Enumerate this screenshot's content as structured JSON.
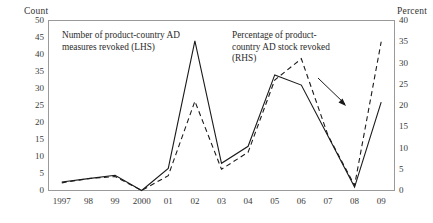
{
  "chart_data": {
    "type": "line",
    "title": "",
    "xlabel": "",
    "ylabel": "Count",
    "y2label": "Percent",
    "grid": false,
    "legend_position": "inline-annotations",
    "categories": [
      "1997",
      "98",
      "99",
      "2000",
      "01",
      "02",
      "03",
      "04",
      "05",
      "06",
      "07",
      "08",
      "09"
    ],
    "x": [
      1997,
      1998,
      1999,
      2000,
      2001,
      2002,
      2003,
      2004,
      2005,
      2006,
      2007,
      2008,
      2009
    ],
    "ylim": [
      0,
      50
    ],
    "y2lim": [
      0,
      40
    ],
    "yticks": [
      0,
      5,
      10,
      15,
      20,
      25,
      30,
      35,
      40,
      45,
      50
    ],
    "y2ticks": [
      0,
      5,
      10,
      15,
      20,
      25,
      30,
      35,
      40
    ],
    "series": [
      {
        "name": "Number of product-country AD measures revoked (LHS)",
        "axis": "left",
        "style": "solid",
        "values": [
          2.5,
          3.5,
          4.5,
          0,
          6.5,
          44,
          8,
          13,
          34,
          31,
          16,
          1,
          26
        ]
      },
      {
        "name": "Percentage of product-country AD stock revoked (RHS)",
        "axis": "right",
        "style": "dashed",
        "values": [
          1.8,
          2.8,
          3.3,
          0,
          3.5,
          21,
          5,
          9,
          26,
          31,
          13,
          1.2,
          35
        ]
      }
    ],
    "annotations": [
      {
        "id": "lhs-label",
        "text": "Number of product-country AD measures revoked (LHS)",
        "lines": [
          "Number of product-country AD",
          "measures revoked (LHS)"
        ]
      },
      {
        "id": "rhs-label",
        "text": "Percentage of product-country AD stock revoked (RHS)",
        "lines": [
          "Percentage of product-",
          "country AD stock revoked",
          "(RHS)"
        ],
        "arrow": true
      }
    ],
    "colors": {
      "line": "#1a1a1a",
      "frame": "#9a9a9a",
      "text": "#2b2b2b",
      "background": "#ffffff"
    }
  }
}
